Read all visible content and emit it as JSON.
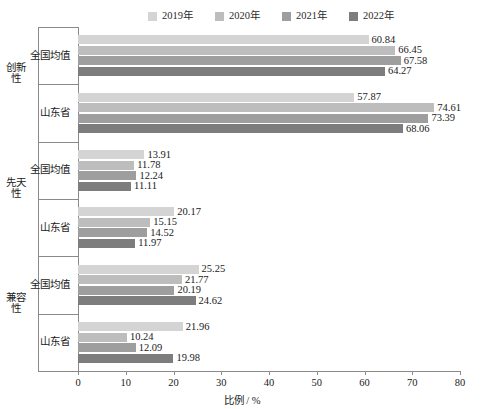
{
  "chart_data": {
    "type": "bar",
    "orientation": "horizontal",
    "title": "",
    "xlabel": "比例 / %",
    "ylabel": "",
    "xlim": [
      0,
      80
    ],
    "xticks": [
      0,
      10,
      20,
      30,
      40,
      50,
      60,
      70,
      80
    ],
    "grid": false,
    "legend_position": "top",
    "legend": [
      "2019年",
      "2020年",
      "2021年",
      "2022年"
    ],
    "series": [
      {
        "name": "2019年",
        "color": "#d4d4d4",
        "values": [
          60.84,
          57.87,
          13.91,
          20.17,
          25.25,
          21.96
        ]
      },
      {
        "name": "2020年",
        "color": "#bdbdbd",
        "values": [
          66.45,
          74.61,
          11.78,
          15.15,
          21.77,
          10.24
        ]
      },
      {
        "name": "2021年",
        "color": "#9e9e9e",
        "values": [
          67.58,
          73.39,
          12.24,
          14.52,
          20.19,
          12.09
        ]
      },
      {
        "name": "2022年",
        "color": "#7d7d7d",
        "values": [
          64.27,
          68.06,
          11.11,
          11.97,
          24.62,
          19.98
        ]
      }
    ],
    "categories": [
      "全国均值",
      "山东省",
      "全国均值",
      "山东省",
      "全国均值",
      "山东省"
    ],
    "groups": [
      {
        "label": "创新性",
        "subgroups": [
          {
            "label": "全国均值",
            "bars": [
              {
                "series": "2019年",
                "value": 60.84,
                "value_text": "60.84",
                "color": "#d4d4d4"
              },
              {
                "series": "2020年",
                "value": 66.45,
                "value_text": "66.45",
                "color": "#bdbdbd"
              },
              {
                "series": "2021年",
                "value": 67.58,
                "value_text": "67.58",
                "color": "#9e9e9e"
              },
              {
                "series": "2022年",
                "value": 64.27,
                "value_text": "64.27",
                "color": "#7d7d7d"
              }
            ]
          },
          {
            "label": "山东省",
            "bars": [
              {
                "series": "2019年",
                "value": 57.87,
                "value_text": "57.87",
                "color": "#d4d4d4"
              },
              {
                "series": "2020年",
                "value": 74.61,
                "value_text": "74.61",
                "color": "#bdbdbd"
              },
              {
                "series": "2021年",
                "value": 73.39,
                "value_text": "73.39",
                "color": "#9e9e9e"
              },
              {
                "series": "2022年",
                "value": 68.06,
                "value_text": "68.06",
                "color": "#7d7d7d"
              }
            ]
          }
        ]
      },
      {
        "label": "先天性",
        "subgroups": [
          {
            "label": "全国均值",
            "bars": [
              {
                "series": "2019年",
                "value": 13.91,
                "value_text": "13.91",
                "color": "#d4d4d4"
              },
              {
                "series": "2020年",
                "value": 11.78,
                "value_text": "11.78",
                "color": "#bdbdbd"
              },
              {
                "series": "2021年",
                "value": 12.24,
                "value_text": "12.24",
                "color": "#9e9e9e"
              },
              {
                "series": "2022年",
                "value": 11.11,
                "value_text": "11.11",
                "color": "#7d7d7d"
              }
            ]
          },
          {
            "label": "山东省",
            "bars": [
              {
                "series": "2019年",
                "value": 20.17,
                "value_text": "20.17",
                "color": "#d4d4d4"
              },
              {
                "series": "2020年",
                "value": 15.15,
                "value_text": "15.15",
                "color": "#bdbdbd"
              },
              {
                "series": "2021年",
                "value": 14.52,
                "value_text": "14.52",
                "color": "#9e9e9e"
              },
              {
                "series": "2022年",
                "value": 11.97,
                "value_text": "11.97",
                "color": "#7d7d7d"
              }
            ]
          }
        ]
      },
      {
        "label": "兼容性",
        "subgroups": [
          {
            "label": "全国均值",
            "bars": [
              {
                "series": "2019年",
                "value": 25.25,
                "value_text": "25.25",
                "color": "#d4d4d4"
              },
              {
                "series": "2020年",
                "value": 21.77,
                "value_text": "21.77",
                "color": "#bdbdbd"
              },
              {
                "series": "2021年",
                "value": 20.19,
                "value_text": "20.19",
                "color": "#9e9e9e"
              },
              {
                "series": "2022年",
                "value": 24.62,
                "value_text": "24.62",
                "color": "#7d7d7d"
              }
            ]
          },
          {
            "label": "山东省",
            "bars": [
              {
                "series": "2019年",
                "value": 21.96,
                "value_text": "21.96",
                "color": "#d4d4d4"
              },
              {
                "series": "2020年",
                "value": 10.24,
                "value_text": "10.24",
                "color": "#bdbdbd"
              },
              {
                "series": "2021年",
                "value": 12.09,
                "value_text": "12.09",
                "color": "#9e9e9e"
              },
              {
                "series": "2022年",
                "value": 19.98,
                "value_text": "19.98",
                "color": "#7d7d7d"
              }
            ]
          }
        ]
      }
    ]
  },
  "axis": {
    "x_tick_labels": [
      "0",
      "10",
      "20",
      "30",
      "40",
      "50",
      "60",
      "70",
      "80"
    ],
    "x_axis_title": "比例 / %"
  },
  "colors": {
    "series_2019": "#d4d4d4",
    "series_2020": "#bdbdbd",
    "series_2021": "#9e9e9e",
    "series_2022": "#7d7d7d",
    "axis": "#8a8a8a",
    "text": "#1a1a1a"
  }
}
